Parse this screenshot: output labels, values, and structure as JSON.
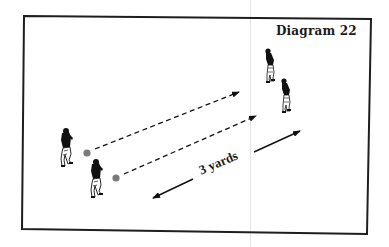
{
  "diagram": {
    "title": "Diagram 22",
    "distance_label": "3 yards",
    "colors": {
      "border": "#1e1e1e",
      "ink": "#111111",
      "ball": "#7a7a7a",
      "background": "#ffffff"
    },
    "field": {
      "x1": 23,
      "y1": 17,
      "x2": 369,
      "y2": 232
    },
    "players": [
      {
        "id": "passer-1",
        "role": "passer",
        "x": 68,
        "y": 128
      },
      {
        "id": "passer-2",
        "role": "passer",
        "x": 98,
        "y": 158
      },
      {
        "id": "receiver-1",
        "role": "receiver",
        "x": 271,
        "y": 48
      },
      {
        "id": "receiver-2",
        "role": "receiver",
        "x": 287,
        "y": 78
      }
    ],
    "balls": [
      {
        "id": "ball-1",
        "x": 87,
        "y": 153
      },
      {
        "id": "ball-2",
        "x": 116,
        "y": 178
      }
    ],
    "passes": [
      {
        "id": "pass-1",
        "x1": 95,
        "y1": 149,
        "x2": 239,
        "y2": 92
      },
      {
        "id": "pass-2",
        "x1": 124,
        "y1": 174,
        "x2": 256,
        "y2": 116
      }
    ],
    "measurement": {
      "arrow_right": {
        "x1": 254,
        "y1": 152,
        "x2": 300,
        "y2": 131
      },
      "arrow_left": {
        "x1": 193,
        "y1": 179,
        "x2": 153,
        "y2": 198
      }
    }
  }
}
